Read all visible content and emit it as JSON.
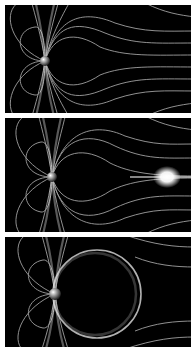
{
  "figure": {
    "background_color": "#000000",
    "line_color": "#cfcfcf",
    "panels": [
      {
        "id": "panel-1",
        "label": "dipole field lines",
        "top": 5,
        "height": 108,
        "feature": "none"
      },
      {
        "id": "panel-2",
        "label": "field lines with bright plasma blob",
        "top": 118,
        "height": 114,
        "feature": "bright-blob",
        "blob": {
          "x": 162,
          "y": 59
        }
      },
      {
        "id": "panel-3",
        "label": "field lines with circular ring",
        "top": 237,
        "height": 110,
        "feature": "ring",
        "ring": {
          "cx": 90,
          "cy": 57,
          "r": 44
        }
      }
    ]
  }
}
